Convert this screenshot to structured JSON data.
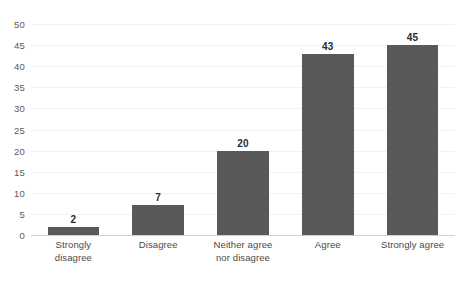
{
  "chart_data": {
    "type": "bar",
    "title": "",
    "subtitle": "",
    "xlabel": "",
    "ylabel": "",
    "categories": [
      "Strongly disagree",
      "Disagree",
      "Neither agree nor disagree",
      "Agree",
      "Strongly agree"
    ],
    "category_lines": [
      [
        "Strongly",
        "disagree"
      ],
      [
        "Disagree"
      ],
      [
        "Neither agree",
        "nor disagree"
      ],
      [
        "Agree"
      ],
      [
        "Strongly agree"
      ]
    ],
    "values": [
      2,
      7,
      20,
      43,
      45
    ],
    "data_labels": [
      "2",
      "7",
      "20",
      "43",
      "45"
    ],
    "ylim": [
      0,
      50
    ],
    "y_ticks": [
      0,
      5,
      10,
      15,
      20,
      25,
      30,
      35,
      40,
      45,
      50
    ],
    "y_tick_labels": [
      "0",
      "5",
      "10",
      "15",
      "20",
      "25",
      "30",
      "35",
      "40",
      "45",
      "50"
    ],
    "grid": true,
    "grid_axis": "y",
    "legend": false,
    "legend_position": "none",
    "bar_color": "#595959",
    "gridline_color": "#F2F2F2",
    "axis_line_color": "#D0D0D0",
    "label_color": "#4A4A4A",
    "value_label_color": "#2B2B2B"
  },
  "caption": ""
}
